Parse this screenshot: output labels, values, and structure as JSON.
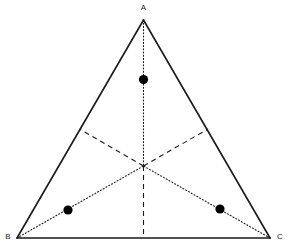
{
  "figure": {
    "kind": "geometry-diagram",
    "canvas": {
      "width": 292,
      "height": 252
    },
    "background_color": "#ffffff",
    "line_color": "#1a1a1a",
    "dot_color": "#000000"
  },
  "vertices": {
    "A": {
      "label": "A",
      "x": 143.5,
      "y": 20,
      "label_x": 143.5,
      "label_y": 8
    },
    "B": {
      "label": "B",
      "x": 17,
      "y": 238,
      "label_x": 8,
      "label_y": 237
    },
    "C": {
      "label": "C",
      "x": 270,
      "y": 238,
      "label_x": 280,
      "label_y": 237
    }
  },
  "midpoints": {
    "M_AB": {
      "label": "",
      "x": 79.5,
      "y": 129
    },
    "M_AC": {
      "label": "",
      "x": 208,
      "y": 129
    },
    "M_BC": {
      "label": "",
      "x": 143.5,
      "y": 238
    }
  },
  "centroid": {
    "label": "",
    "x": 143.5,
    "y": 166
  },
  "edges": [
    {
      "name": "edge-ab",
      "from": "A",
      "to": "B",
      "style": "solid"
    },
    {
      "name": "edge-ac",
      "from": "A",
      "to": "C",
      "style": "solid"
    },
    {
      "name": "edge-bc",
      "from": "B",
      "to": "C",
      "style": "solid"
    }
  ],
  "cevians": [
    {
      "name": "median-a-to-centroid",
      "style": "dotted",
      "x1": 143.5,
      "y1": 20,
      "x2": 143.5,
      "y2": 166
    },
    {
      "name": "median-centroid-to-bc",
      "style": "dashed",
      "x1": 143.5,
      "y1": 166,
      "x2": 143.5,
      "y2": 238
    },
    {
      "name": "median-b-to-centroid",
      "style": "dotted",
      "x1": 17,
      "y1": 238,
      "x2": 143.5,
      "y2": 166
    },
    {
      "name": "median-centroid-to-ac-midpoint",
      "style": "dashed",
      "x1": 143.5,
      "y1": 166,
      "x2": 208,
      "y2": 129
    },
    {
      "name": "median-c-to-centroid",
      "style": "dotted",
      "x1": 270,
      "y1": 238,
      "x2": 143.5,
      "y2": 166
    },
    {
      "name": "median-centroid-to-ab-midpoint",
      "style": "dashed",
      "x1": 143.5,
      "y1": 166,
      "x2": 79.5,
      "y2": 129
    }
  ],
  "points": [
    {
      "name": "point-top",
      "x": 143.5,
      "y": 79.5,
      "r": 4.6,
      "on_line": "median-a-to-centroid"
    },
    {
      "name": "point-left",
      "x": 68,
      "y": 210,
      "r": 4.6,
      "on_line": "median-b-to-centroid"
    },
    {
      "name": "point-right",
      "x": 220,
      "y": 209,
      "r": 4.6,
      "on_line": "median-c-to-centroid"
    }
  ],
  "chart_data": {
    "type": "scatter",
    "xlabel": "",
    "ylabel": "",
    "xlim": [
      0,
      292
    ],
    "ylim": [
      252,
      0
    ],
    "grid": false,
    "legend": "none",
    "annotations": [
      "A",
      "B",
      "C"
    ],
    "series": [
      {
        "name": "triangle-vertices",
        "x": [
          143.5,
          17,
          270
        ],
        "y": [
          20,
          238,
          238
        ],
        "labels": [
          "A",
          "B",
          "C"
        ]
      },
      {
        "name": "marked-points",
        "x": [
          143.5,
          68,
          220
        ],
        "y": [
          79.5,
          210,
          209
        ],
        "labels": [
          "",
          "",
          ""
        ]
      },
      {
        "name": "centroid",
        "x": [
          143.5
        ],
        "y": [
          166
        ],
        "labels": [
          ""
        ]
      }
    ]
  }
}
